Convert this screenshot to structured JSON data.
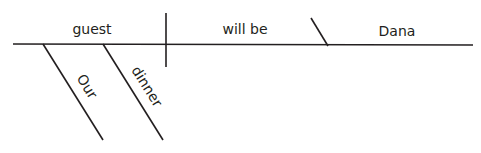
{
  "diagram": {
    "type": "sentence-diagram",
    "subject": "guest",
    "verb": "will be",
    "predicate_nominative": "Dana",
    "modifiers": [
      {
        "word": "Our",
        "modifies": "guest"
      },
      {
        "word": "dinner",
        "modifies": "guest"
      }
    ],
    "line_color": "#231f20"
  }
}
